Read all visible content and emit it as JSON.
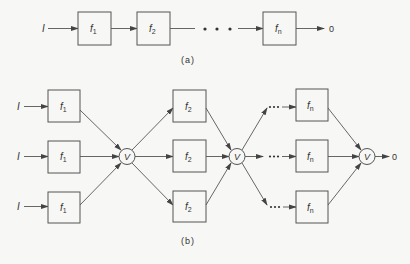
{
  "figure_a": {
    "caption": "(a)",
    "input_label": "I",
    "output_label": "0",
    "ellipsis": "• • •",
    "blocks": [
      {
        "name": "f",
        "sub": "1"
      },
      {
        "name": "f",
        "sub": "2"
      },
      {
        "name": "f",
        "sub": "n"
      }
    ]
  },
  "figure_b": {
    "caption": "(b)",
    "input_label": "I",
    "output_label": "0",
    "voter_label": "V",
    "ellipsis": "•••",
    "stages": [
      {
        "name": "f",
        "sub": "1"
      },
      {
        "name": "f",
        "sub": "2"
      },
      {
        "name": "f",
        "sub": "n"
      }
    ],
    "rows": 3
  },
  "colors": {
    "stroke": "#555555",
    "text": "#333333",
    "background": "#f7f7f5"
  }
}
